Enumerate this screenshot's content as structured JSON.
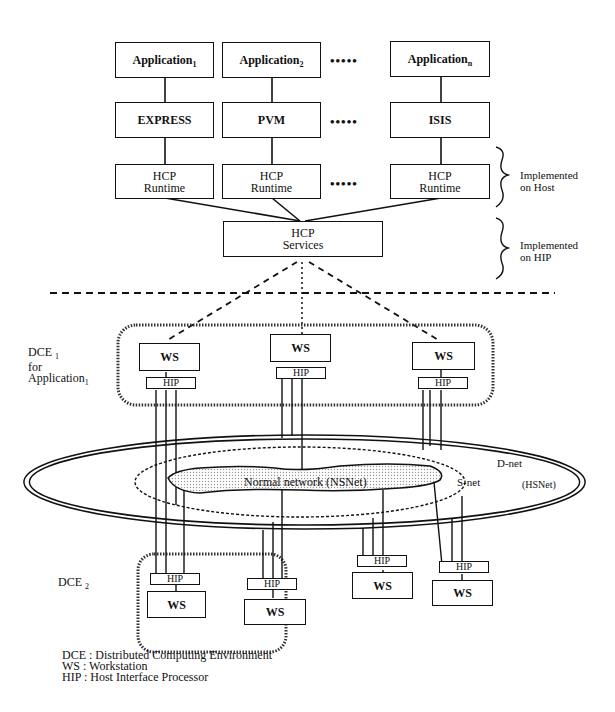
{
  "applications": [
    {
      "label": "Application",
      "sub": "1"
    },
    {
      "label": "Application",
      "sub": "2"
    },
    {
      "label": "Application",
      "sub": "n"
    }
  ],
  "middleware": [
    "EXPRESS",
    "PVM",
    "ISIS"
  ],
  "runtimes": [
    {
      "line1": "HCP",
      "line2": "Runtime"
    },
    {
      "line1": "HCP",
      "line2": "Runtime"
    },
    {
      "line1": "HCP",
      "line2": "Runtime"
    }
  ],
  "ellipsis": "•••••",
  "services": {
    "line1": "HCP",
    "line2": "Services"
  },
  "braces": {
    "host": {
      "line1": "Implemented",
      "line2": "on Host"
    },
    "hip": {
      "line1": "Implemented",
      "line2": "on HIP"
    }
  },
  "dce1": {
    "line1": "DCE",
    "sub1": "1",
    "line2": "for",
    "line3": "Application",
    "sub3": "1"
  },
  "dce2": {
    "label": "DCE",
    "sub": "2"
  },
  "ws_label": "WS",
  "hip_label": "HIP",
  "network": {
    "normal": "Normal  network (NSNet)",
    "snet": "S-net",
    "dnet": "D-net",
    "hsnet": "(HSNet)"
  },
  "legend": [
    "DCE : Distributed Computing Environment",
    "WS : Workstation",
    "HIP : Host Interface Processor"
  ]
}
